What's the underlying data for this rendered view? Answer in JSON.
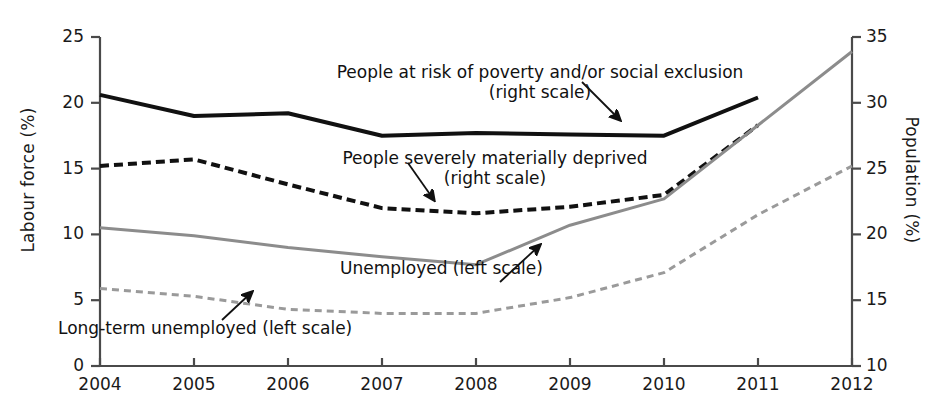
{
  "chart_data": {
    "type": "line",
    "title": "",
    "xlabel": "",
    "ylabel": "Labour force (%)",
    "y2label": "Population (%)",
    "x": [
      2004,
      2005,
      2006,
      2007,
      2008,
      2009,
      2010,
      2011,
      2012
    ],
    "xlim": [
      2004,
      2012
    ],
    "ylim": [
      0,
      25
    ],
    "y2lim": [
      10,
      35
    ],
    "yticks": [
      0,
      5,
      10,
      15,
      20,
      25
    ],
    "y2ticks": [
      10,
      15,
      20,
      25,
      30,
      35
    ],
    "xticks": [
      "2004",
      "2005",
      "2006",
      "2007",
      "2008",
      "2009",
      "2010",
      "2011",
      "2012"
    ],
    "grid": false,
    "legend": "inline annotations with arrows",
    "series": [
      {
        "name": "People at risk of poverty and/or social exclusion",
        "scale": "right",
        "axis_label": "(right scale)",
        "style": "solid",
        "color": "#111111",
        "width": 4,
        "x": [
          2004,
          2005,
          2006,
          2007,
          2008,
          2009,
          2010,
          2011
        ],
        "values": [
          30.6,
          29.0,
          29.2,
          27.5,
          27.7,
          27.6,
          27.5,
          30.4
        ]
      },
      {
        "name": "People severely materially deprived",
        "scale": "right",
        "axis_label": "(right scale)",
        "style": "dashed",
        "color": "#111111",
        "width": 4,
        "x": [
          2004,
          2005,
          2006,
          2007,
          2008,
          2009,
          2010,
          2011
        ],
        "values": [
          25.2,
          25.7,
          23.8,
          22.0,
          21.6,
          22.1,
          23.0,
          28.3
        ]
      },
      {
        "name": "Unemployed",
        "scale": "left",
        "axis_label": "(left scale)",
        "style": "solid",
        "color": "#8c8c8c",
        "width": 3,
        "x": [
          2004,
          2005,
          2006,
          2007,
          2008,
          2009,
          2010,
          2011,
          2012
        ],
        "values": [
          10.5,
          9.9,
          9.0,
          8.3,
          7.7,
          10.7,
          12.7,
          18.3,
          23.9
        ]
      },
      {
        "name": "Long-term unemployed",
        "scale": "left",
        "axis_label": "(left scale)",
        "style": "dashed",
        "color": "#9a9a9a",
        "width": 3,
        "x": [
          2004,
          2005,
          2006,
          2007,
          2008,
          2009,
          2010,
          2011,
          2012
        ],
        "values": [
          5.9,
          5.3,
          4.3,
          4.0,
          4.0,
          5.2,
          7.1,
          11.5,
          15.2
        ]
      }
    ],
    "annotations": [
      {
        "id": "poverty",
        "line1": "People at risk of poverty and/or social exclusion",
        "line2": "(right scale)"
      },
      {
        "id": "deprived",
        "line1": "People severely materially deprived",
        "line2": "(right scale)"
      },
      {
        "id": "unemployed",
        "line1": "Unemployed (left scale)",
        "line2": ""
      },
      {
        "id": "long-term",
        "line1": "Long-term unemployed (left scale)",
        "line2": ""
      }
    ]
  },
  "axes": {
    "left": {
      "title": "Labour force (%)",
      "ticks": [
        "25",
        "20",
        "15",
        "10",
        "5",
        "0"
      ]
    },
    "right": {
      "title": "Population (%)",
      "ticks": [
        "35",
        "30",
        "25",
        "20",
        "15",
        "10"
      ]
    },
    "bottom": {
      "ticks": [
        "2004",
        "2005",
        "2006",
        "2007",
        "2008",
        "2009",
        "2010",
        "2011",
        "2012"
      ]
    }
  },
  "labels": {
    "poverty_line1": "People at risk of poverty and/or social exclusion",
    "poverty_line2": "(right scale)",
    "deprived_line1": "People severely materially deprived",
    "deprived_line2": "(right scale)",
    "unemployed": "Unemployed (left scale)",
    "longterm": "Long-term unemployed (left scale)"
  },
  "colors": {
    "dark": "#111111",
    "gray": "#8c8c8c",
    "gray_light": "#9a9a9a",
    "axis": "#4a4a4a",
    "background": "#ffffff"
  }
}
